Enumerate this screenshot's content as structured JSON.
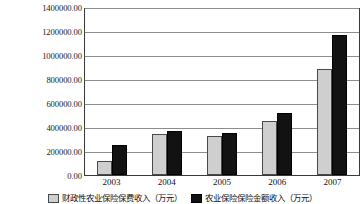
{
  "chart_data": {
    "type": "bar",
    "title": "",
    "xlabel": "",
    "ylabel": "",
    "categories": [
      "2003",
      "2004",
      "2005",
      "2006",
      "2007"
    ],
    "series": [
      {
        "name": "财政性农业保险保费收入（万元）",
        "color": "#cfcfcf",
        "values": [
          120000,
          340000,
          330000,
          450000,
          890000
        ]
      },
      {
        "name": "农业保险保险金额收入（万元）",
        "color": "#121212",
        "values": [
          250000,
          370000,
          350000,
          520000,
          1170000
        ]
      }
    ],
    "ylim": [
      0,
      1400000
    ],
    "ytick_step": 200000,
    "ytick_labels": [
      "1400000.00",
      "1200000.00",
      "1000000.00",
      "800000.00",
      "600000.00",
      "400000.00",
      "200000.00",
      "0.00"
    ],
    "grid": true,
    "legend_position": "bottom"
  },
  "legend": {
    "entries": [
      {
        "label": "财政性农业保险保费收入（万元）"
      },
      {
        "label": "农业保险保险金额收入（万元）"
      }
    ]
  }
}
